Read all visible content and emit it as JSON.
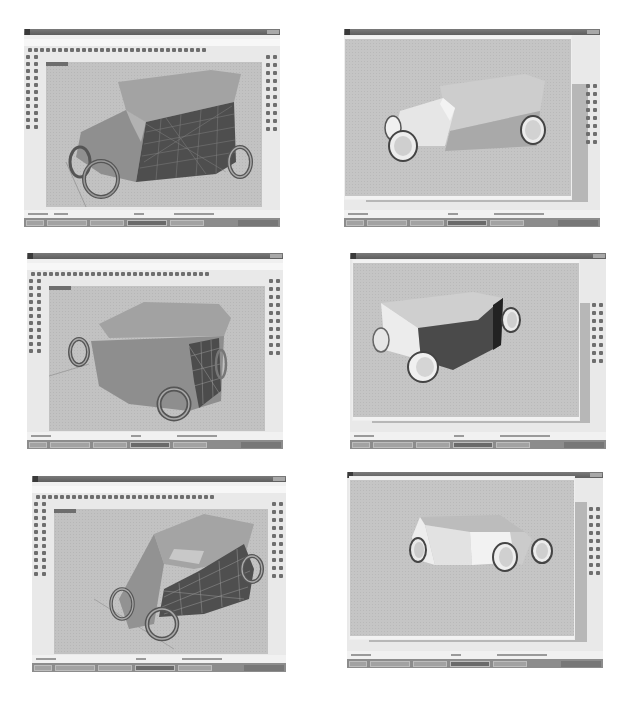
{
  "figure": {
    "layout": {
      "rows": 3,
      "columns": 2
    }
  },
  "panels": [
    {
      "id": 1,
      "position": "row1-left",
      "view": "perspective-wireframe-shaded",
      "content": "car-body-with-surface-isocurves",
      "window": "modeling"
    },
    {
      "id": 2,
      "position": "row1-right",
      "view": "render-window",
      "content": "rendered-car-body",
      "window": "render"
    },
    {
      "id": 3,
      "position": "row2-left",
      "view": "perspective-wireframe-shaded",
      "content": "car-body-rear-with-surface-isocurves",
      "window": "modeling"
    },
    {
      "id": 4,
      "position": "row2-right",
      "view": "render-window",
      "content": "rendered-car-body-rear",
      "window": "render"
    },
    {
      "id": 5,
      "position": "row3-left",
      "view": "perspective-wireframe-shaded",
      "content": "car-body-with-surface-isocurves",
      "window": "modeling"
    },
    {
      "id": 6,
      "position": "row3-right",
      "view": "render-window",
      "content": "rendered-car-body-side",
      "window": "render"
    }
  ],
  "colors": {
    "page_background": "#ffffff",
    "viewport": "#c2c2c2",
    "car_body_light": "#9a9a9a",
    "car_body_dark": "#555555",
    "render_body_light": "#e4e4e4",
    "render_body_mid": "#b0b0b0",
    "render_body_dark": "#5a5a5a",
    "titlebar": "#6a6a6a",
    "taskbar": "#8c8c8c"
  }
}
